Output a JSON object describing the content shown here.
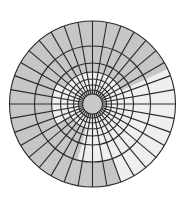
{
  "diagram": {
    "type": "polar-azimuthal-graticule",
    "canvas": {
      "width": 186,
      "height": 198,
      "background": "#ffffff"
    },
    "center": {
      "x": 92.5,
      "y": 104
    },
    "outer_radius": 83,
    "pole_disc_radius": 10,
    "parallel_radii": [
      14,
      19,
      25,
      32,
      41,
      58,
      83
    ],
    "meridian_count": 36,
    "meridian_spacing_deg": 10,
    "colors": {
      "line": "#2a2a2a",
      "land": "#c6c6c6",
      "water": "#efefef",
      "pole_disc": "#c8c8c8"
    },
    "line_width": 1.1,
    "land_regions": [
      {
        "name": "top-land",
        "start_deg": -150,
        "end_deg": -25,
        "r_in": 32,
        "r_out": 83
      },
      {
        "name": "left-land",
        "start_deg": 150,
        "end_deg": 215,
        "r_in": 41,
        "r_out": 83
      },
      {
        "name": "bottom-left-land",
        "start_deg": 105,
        "end_deg": 150,
        "r_in": 25,
        "r_out": 83
      },
      {
        "name": "bottom-land",
        "start_deg": 70,
        "end_deg": 105,
        "r_in": 58,
        "r_out": 83
      },
      {
        "name": "inner-ring-land",
        "start_deg": 0,
        "end_deg": 360,
        "r_in": 10,
        "r_out": 14
      }
    ]
  }
}
